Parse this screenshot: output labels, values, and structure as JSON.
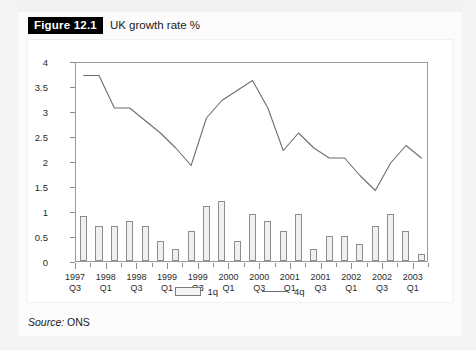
{
  "figure": {
    "badge": "Figure 12.1",
    "title": "UK growth rate %"
  },
  "source": {
    "prefix": "Source:",
    "value": "ONS"
  },
  "legend": {
    "bar_label": "1q",
    "line_label": "4q"
  },
  "chart_data": {
    "type": "bar",
    "title": "UK growth rate %",
    "xlabel": "",
    "ylabel": "",
    "ylim": [
      0,
      4
    ],
    "ytick_values": [
      0,
      0.5,
      1,
      1.5,
      2,
      2.5,
      3,
      3.5,
      4
    ],
    "ytick_labels": [
      "0",
      "0.5",
      "1",
      "1.5",
      "2",
      "2.5",
      "3",
      "3.5",
      "4"
    ],
    "grid": false,
    "legend_position": "bottom-center",
    "categories": [
      "1997 Q3",
      "1997 Q4",
      "1998 Q1",
      "1998 Q2",
      "1998 Q3",
      "1998 Q4",
      "1999 Q1",
      "1999 Q2",
      "1999 Q3",
      "1999 Q4",
      "2000 Q1",
      "2000 Q2",
      "2000 Q3",
      "2000 Q4",
      "2001 Q1",
      "2001 Q2",
      "2001 Q3",
      "2001 Q4",
      "2002 Q1",
      "2002 Q2",
      "2002 Q3",
      "2002 Q4",
      "2003 Q1"
    ],
    "xtick_labels": [
      {
        "line1": "1997",
        "line2": "Q3"
      },
      {
        "line1": "1998",
        "line2": "Q1"
      },
      {
        "line1": "1998",
        "line2": "Q3"
      },
      {
        "line1": "1999",
        "line2": "Q1"
      },
      {
        "line1": "1999",
        "line2": "Q3"
      },
      {
        "line1": "2000",
        "line2": "Q1"
      },
      {
        "line1": "2000",
        "line2": "Q3"
      },
      {
        "line1": "2001",
        "line2": "Q1"
      },
      {
        "line1": "2001",
        "line2": "Q3"
      },
      {
        "line1": "2002",
        "line2": "Q1"
      },
      {
        "line1": "2002",
        "line2": "Q3"
      },
      {
        "line1": "2003",
        "line2": "Q1"
      }
    ],
    "series": [
      {
        "name": "1q",
        "type": "bar",
        "values": [
          0.9,
          0.7,
          0.7,
          0.8,
          0.7,
          0.4,
          0.25,
          0.6,
          1.1,
          1.2,
          0.4,
          0.95,
          0.8,
          0.6,
          0.95,
          0.25,
          0.5,
          0.5,
          0.35,
          0.7,
          0.95,
          0.6,
          0.15
        ]
      },
      {
        "name": "4q",
        "type": "line",
        "values": [
          3.75,
          3.75,
          3.1,
          3.1,
          2.85,
          2.6,
          2.3,
          1.95,
          2.9,
          3.25,
          3.45,
          3.65,
          3.1,
          2.25,
          2.6,
          2.3,
          2.1,
          2.1,
          1.75,
          1.45,
          2.0,
          2.35,
          2.1
        ]
      }
    ]
  }
}
